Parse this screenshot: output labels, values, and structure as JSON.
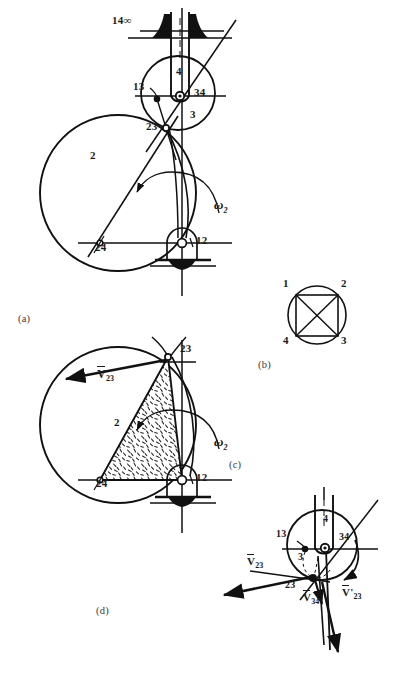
{
  "figure": {
    "width": 399,
    "height": 685,
    "background": "#ffffff",
    "ink": "#111111"
  },
  "panels": [
    {
      "id": "a",
      "caption": "(a)",
      "caption_pos": {
        "x": 18,
        "y": 318
      },
      "description": "Mechanism skeleton with link 2 circle, link 3 circle, slider link 4 and ground"
    },
    {
      "id": "b",
      "caption": "(b)",
      "caption_pos": {
        "x": 258,
        "y": 364
      },
      "description": "Instant center polygon: circle with inscribed square and diagonals"
    },
    {
      "id": "c",
      "caption": "(c)",
      "caption_pos": {
        "x": 229,
        "y": 464
      },
      "description": "Velocity detail at joint 23 with vectors"
    },
    {
      "id": "d",
      "caption": "(d)",
      "caption_pos": {
        "x": 96,
        "y": 610
      },
      "description": "Hatched body 2 triangle with velocity vector"
    }
  ],
  "panel_a": {
    "labels": [
      {
        "name": "label-14-infinity",
        "text": "14∞",
        "x": 112,
        "y": 20
      },
      {
        "name": "label-13",
        "text": "13",
        "x": 133,
        "y": 86
      },
      {
        "name": "label-34",
        "text": "34",
        "x": 194,
        "y": 92
      },
      {
        "name": "label-4",
        "text": "4",
        "x": 178,
        "y": 71
      },
      {
        "name": "label-3",
        "text": "3",
        "x": 190,
        "y": 114
      },
      {
        "name": "label-23",
        "text": "23",
        "x": 146,
        "y": 126
      },
      {
        "name": "label-2",
        "text": "2",
        "x": 90,
        "y": 155
      },
      {
        "name": "label-24",
        "text": "24",
        "x": 95,
        "y": 247
      },
      {
        "name": "label-12",
        "text": "12",
        "x": 196,
        "y": 240
      },
      {
        "name": "label-omega-2",
        "text": "ω",
        "sub": "2",
        "x": 214,
        "y": 203
      }
    ]
  },
  "panel_b": {
    "circle": {
      "cx": 317,
      "cy": 315,
      "r": 29
    },
    "nodes": [
      {
        "name": "node-1",
        "text": "1",
        "x": 287,
        "y": 283,
        "px": 296,
        "py": 295
      },
      {
        "name": "node-2",
        "text": "2",
        "x": 341,
        "y": 283,
        "px": 338,
        "py": 295
      },
      {
        "name": "node-3",
        "text": "3",
        "x": 341,
        "y": 339,
        "px": 338,
        "py": 336
      },
      {
        "name": "node-4",
        "text": "4",
        "x": 287,
        "y": 339,
        "px": 296,
        "py": 336
      }
    ]
  },
  "panel_c": {
    "labels": [
      {
        "name": "label-13",
        "text": "13",
        "x": 276,
        "y": 533
      },
      {
        "name": "label-34",
        "text": "34",
        "x": 339,
        "y": 537
      },
      {
        "name": "label-4",
        "text": "4",
        "x": 325,
        "y": 519
      },
      {
        "name": "label-3",
        "text": "3",
        "x": 298,
        "y": 557
      },
      {
        "name": "label-23",
        "text": "23",
        "x": 285,
        "y": 585
      },
      {
        "name": "label-v23",
        "text": "V",
        "sub": "23",
        "bar": true,
        "prime": false,
        "x": 247,
        "y": 561
      },
      {
        "name": "label-v34",
        "text": "V",
        "sub": "34",
        "bar": true,
        "prime": false,
        "x": 303,
        "y": 597
      },
      {
        "name": "label-v23-prime",
        "text": "V",
        "sub": "23",
        "bar": true,
        "prime": true,
        "x": 342,
        "y": 592
      }
    ]
  },
  "panel_d": {
    "labels": [
      {
        "name": "label-23",
        "text": "23",
        "x": 180,
        "y": 348
      },
      {
        "name": "label-v23",
        "text": "V",
        "sub": "23",
        "bar": true,
        "prime": false,
        "x": 97,
        "y": 373
      },
      {
        "name": "label-2",
        "text": "2",
        "x": 114,
        "y": 422
      },
      {
        "name": "label-24",
        "text": "24",
        "x": 96,
        "y": 483
      },
      {
        "name": "label-12",
        "text": "12",
        "x": 196,
        "y": 477
      },
      {
        "name": "label-omega-2",
        "text": "ω",
        "sub": "2",
        "x": 214,
        "y": 440
      }
    ]
  },
  "geometry_notes": {
    "link2_circle_a": {
      "cx": 118,
      "cy": 193,
      "r": 78
    },
    "link3_circle_a": {
      "cx": 178,
      "cy": 93,
      "r": 37
    },
    "link2_circle_d": {
      "cx": 118,
      "cy": 425,
      "r": 78
    },
    "link3_circle_c": {
      "cx": 322,
      "cy": 545,
      "r": 35
    },
    "pivot_12_a": {
      "x": 182,
      "y": 243
    },
    "pivot_12_d": {
      "x": 182,
      "y": 480
    },
    "joint_23_a": {
      "x": 166,
      "y": 128
    },
    "joint_23_d": {
      "x": 168,
      "y": 357
    },
    "joint_23_c": {
      "x": 313,
      "y": 578
    },
    "joint_34_a": {
      "x": 180,
      "y": 96
    },
    "joint_34_c": {
      "x": 325,
      "y": 548
    },
    "joint_13_a": {
      "x": 157,
      "y": 99
    },
    "joint_13_c": {
      "x": 305,
      "y": 549
    },
    "joint_24_a": {
      "x": 100,
      "y": 243
    },
    "joint_24_d": {
      "x": 100,
      "y": 480
    }
  }
}
